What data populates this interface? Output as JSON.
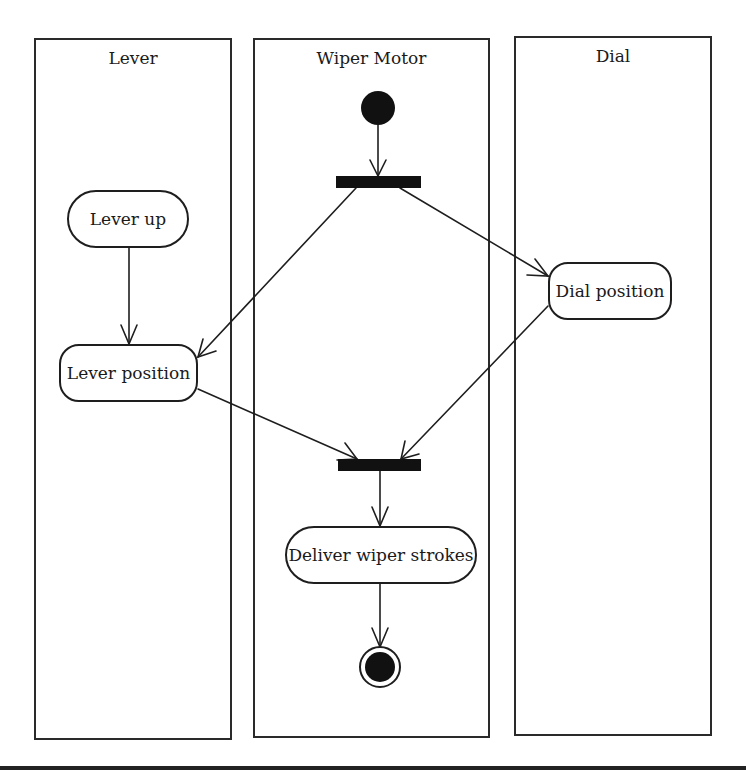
{
  "diagram": {
    "type": "uml-activity-diagram",
    "swimlanes": [
      {
        "id": "lever",
        "label": "Lever"
      },
      {
        "id": "wiper_motor",
        "label": "Wiper Motor"
      },
      {
        "id": "dial",
        "label": "Dial"
      }
    ],
    "nodes": {
      "initial": {
        "kind": "initial",
        "lane": "wiper_motor"
      },
      "fork": {
        "kind": "fork",
        "lane": "wiper_motor"
      },
      "lever_up": {
        "kind": "action",
        "label": "Lever up",
        "lane": "lever"
      },
      "lever_position": {
        "kind": "action",
        "label": "Lever position",
        "lane": "lever"
      },
      "dial_position": {
        "kind": "action",
        "label": "Dial position",
        "lane": "dial"
      },
      "join": {
        "kind": "join",
        "lane": "wiper_motor"
      },
      "deliver": {
        "kind": "action",
        "label": "Deliver wiper strokes",
        "lane": "wiper_motor"
      },
      "final": {
        "kind": "final",
        "lane": "wiper_motor"
      }
    },
    "edges": [
      {
        "from": "initial",
        "to": "fork"
      },
      {
        "from": "fork",
        "to": "lever_position"
      },
      {
        "from": "fork",
        "to": "dial_position"
      },
      {
        "from": "lever_up",
        "to": "lever_position"
      },
      {
        "from": "lever_position",
        "to": "join"
      },
      {
        "from": "dial_position",
        "to": "join"
      },
      {
        "from": "join",
        "to": "deliver"
      },
      {
        "from": "deliver",
        "to": "final"
      }
    ],
    "colors": {
      "stroke": "#1e1e1e",
      "fill_dark": "#111111",
      "background": "#ffffff"
    }
  }
}
